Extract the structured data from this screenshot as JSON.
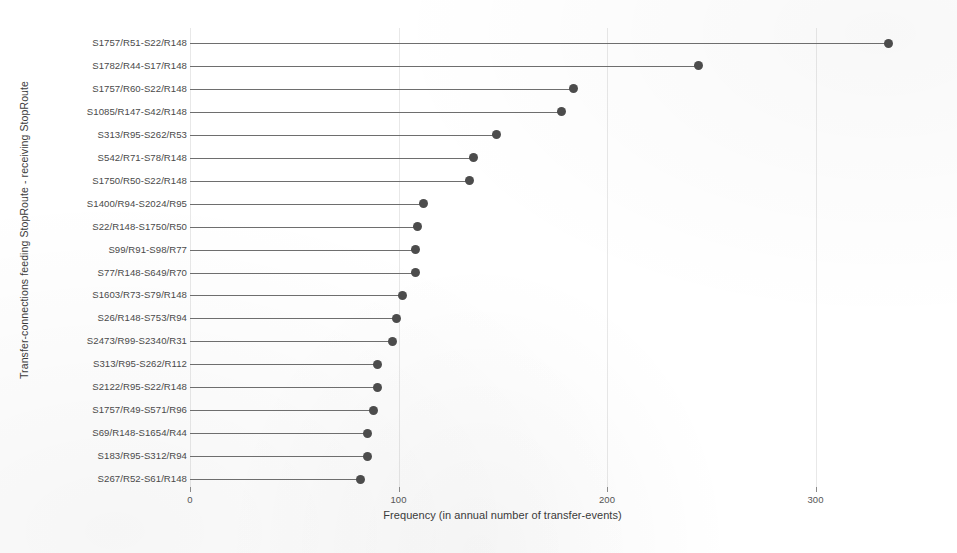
{
  "chart_data": {
    "type": "bar",
    "title": "",
    "subtitle": "",
    "xlabel": "Frequency (in annual number of transfer-events)",
    "ylabel": "Transfer-connections  feeding StopRoute - receiving StopRoute",
    "xlim": [
      0,
      345
    ],
    "ylim": null,
    "grid": true,
    "legend": null,
    "xticks": [
      "0",
      "100",
      "200",
      "300"
    ],
    "xtick_values": [
      0,
      100,
      200,
      300
    ],
    "orientation": "horizontal",
    "marker": "circle",
    "marker_color": "#4c4c4c",
    "line_color": "#6e6e6e",
    "categories": [
      "S1757/R51-S22/R148",
      "S1782/R44-S17/R148",
      "S1757/R60-S22/R148",
      "S1085/R147-S42/R148",
      "S313/R95-S262/R53",
      "S542/R71-S78/R148",
      "S1750/R50-S22/R148",
      "S1400/R94-S2024/R95",
      "S22/R148-S1750/R50",
      "S99/R91-S98/R77",
      "S77/R148-S649/R70",
      "S1603/R73-S79/R148",
      "S26/R148-S753/R94",
      "S2473/R99-S2340/R31",
      "S313/R95-S262/R112",
      "S2122/R95-S22/R148",
      "S1757/R49-S571/R96",
      "S69/R148-S1654/R44",
      "S183/R95-S312/R94",
      "S267/R52-S61/R148"
    ],
    "values": [
      335,
      244,
      184,
      178,
      147,
      136,
      134,
      112,
      109,
      108,
      108,
      102,
      99,
      97,
      90,
      90,
      88,
      85,
      85,
      82
    ]
  },
  "axes": {
    "x_title": "Frequency (in annual number of transfer-events)",
    "y_title": "Transfer-connections  feeding StopRoute - receiving StopRoute"
  }
}
